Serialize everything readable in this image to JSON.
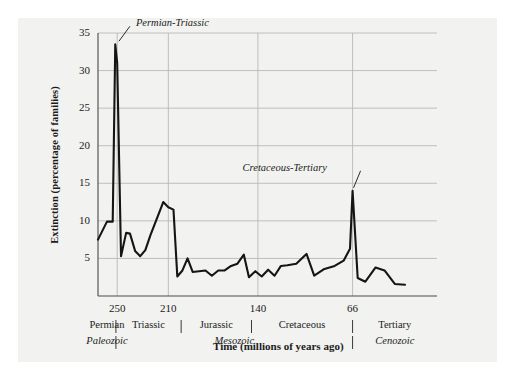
{
  "chart_data": {
    "type": "line",
    "title": "",
    "xlabel": "Time (millions of years ago)",
    "ylabel": "Extinction (percentage of families)",
    "xlim": [
      265,
      0
    ],
    "ylim": [
      0,
      35
    ],
    "grid": true,
    "legend_position": "none",
    "x_ticks": [
      {
        "value": 250,
        "label": "250"
      },
      {
        "value": 210,
        "label": "210"
      },
      {
        "value": 140,
        "label": "140"
      },
      {
        "value": 66,
        "label": "66"
      }
    ],
    "y_ticks": [
      {
        "value": 5,
        "label": "5"
      },
      {
        "value": 10,
        "label": "10"
      },
      {
        "value": 15,
        "label": "15"
      },
      {
        "value": 20,
        "label": "20"
      },
      {
        "value": 25,
        "label": "25"
      },
      {
        "value": 30,
        "label": "30"
      },
      {
        "value": 35,
        "label": "35"
      }
    ],
    "periods": [
      {
        "label": "Permian",
        "start": 265,
        "end": 251
      },
      {
        "label": "Triassic",
        "start": 251,
        "end": 200
      },
      {
        "label": "Jurassic",
        "start": 200,
        "end": 145
      },
      {
        "label": "Cretaceous",
        "start": 145,
        "end": 66
      },
      {
        "label": "Tertiary",
        "start": 66,
        "end": 0
      }
    ],
    "eras": [
      {
        "label": "Paleozoic",
        "start": 265,
        "end": 251
      },
      {
        "label": "Mesozoic",
        "start": 251,
        "end": 66
      },
      {
        "label": "Cenozoic",
        "start": 66,
        "end": 0
      }
    ],
    "annotations": [
      {
        "text": "Permian-Triassic",
        "x": 251,
        "y": 33.5
      },
      {
        "text": "Cretaceous-Tertiary",
        "x": 66,
        "y": 14
      }
    ],
    "series": [
      {
        "name": "Extinction rate",
        "color": "#151515",
        "points": [
          [
            265.0,
            7.5
          ],
          [
            258.0,
            9.9
          ],
          [
            253.5,
            9.9
          ],
          [
            251.5,
            33.5
          ],
          [
            250.0,
            31.0
          ],
          [
            247.0,
            5.3
          ],
          [
            243.0,
            8.4
          ],
          [
            240.0,
            8.3
          ],
          [
            236.0,
            6.0
          ],
          [
            232.0,
            5.3
          ],
          [
            228.0,
            6.1
          ],
          [
            224.0,
            8.1
          ],
          [
            219.0,
            10.3
          ],
          [
            214.0,
            12.5
          ],
          [
            210.0,
            11.8
          ],
          [
            206.0,
            11.5
          ],
          [
            203.0,
            2.6
          ],
          [
            199.0,
            3.4
          ],
          [
            195.0,
            5.0
          ],
          [
            191.0,
            3.2
          ],
          [
            186.0,
            3.3
          ],
          [
            181.0,
            3.4
          ],
          [
            176.0,
            2.7
          ],
          [
            171.0,
            3.4
          ],
          [
            166.0,
            3.4
          ],
          [
            161.0,
            4.0
          ],
          [
            156.0,
            4.3
          ],
          [
            151.0,
            5.5
          ],
          [
            147.0,
            2.5
          ],
          [
            142.0,
            3.3
          ],
          [
            137.0,
            2.6
          ],
          [
            132.0,
            3.5
          ],
          [
            127.0,
            2.7
          ],
          [
            122.0,
            4.0
          ],
          [
            117.0,
            4.1
          ],
          [
            110.0,
            4.3
          ],
          [
            102.0,
            5.6
          ],
          [
            96.0,
            2.7
          ],
          [
            88.0,
            3.6
          ],
          [
            80.0,
            4.0
          ],
          [
            73.0,
            4.7
          ],
          [
            68.0,
            6.3
          ],
          [
            66.0,
            14.0
          ],
          [
            62.0,
            2.4
          ],
          [
            56.0,
            1.9
          ],
          [
            48.0,
            3.8
          ],
          [
            41.0,
            3.4
          ],
          [
            33.0,
            1.6
          ],
          [
            25.0,
            1.5
          ]
        ]
      }
    ]
  }
}
